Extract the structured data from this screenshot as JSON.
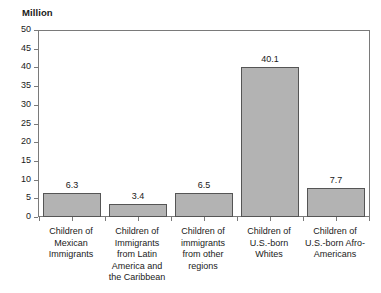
{
  "chart_data": {
    "type": "bar",
    "title": "",
    "subtitle": "",
    "unit_title": "Million",
    "xlabel": "",
    "ylabel": "Million",
    "categories": [
      "Children of Mexican Immigrants",
      "Children of Immigrants from Latin America and the Caribbean",
      "Children of immigrants from other regions",
      "Children of U.S.-born Whites",
      "Children of U.S.-born Afro-Americans"
    ],
    "category_lines": [
      [
        "Children of",
        "Mexican",
        "Immigrants"
      ],
      [
        "Children of",
        "Immigrants",
        "from Latin",
        "America and",
        "the Caribbean"
      ],
      [
        "Children of",
        "immigrants",
        "from other",
        "regions"
      ],
      [
        "Children of",
        "U.S.-born",
        "Whites"
      ],
      [
        "Children of",
        "U.S.-born Afro-",
        "Americans"
      ]
    ],
    "values": [
      6.3,
      3.4,
      6.5,
      40.1,
      7.7
    ],
    "value_labels": [
      "6.3",
      "3.4",
      "6.5",
      "40.1",
      "7.7"
    ],
    "ylim": [
      0,
      50
    ],
    "ytick_step": 5,
    "ytick_labels": [
      "50",
      "45",
      "40",
      "35",
      "30",
      "25",
      "20",
      "15",
      "10",
      "5",
      "0"
    ],
    "grid": false,
    "legend": "none",
    "bar_fill_color": "#b3b3b3",
    "bar_border_color": "#555555",
    "axis_color": "#7a7a7a",
    "background_color": "#ffffff"
  }
}
